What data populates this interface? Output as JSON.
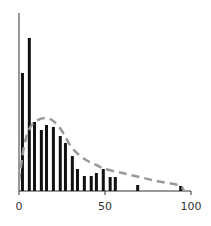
{
  "chart_data": {
    "type": "bar",
    "title": "",
    "xlabel": "",
    "ylabel": "",
    "xlim": [
      0,
      100
    ],
    "ylim": [
      0,
      178
    ],
    "grid": false,
    "legend": null,
    "x_ticks": [
      {
        "value": 0,
        "label": "0"
      },
      {
        "value": 50,
        "label": "50"
      },
      {
        "value": 100,
        "label": "100"
      }
    ],
    "series": [
      {
        "name": "histogram",
        "style": "bars",
        "color": "#111111",
        "x": [
          2,
          6,
          9,
          13,
          16,
          20,
          24,
          27,
          31,
          34,
          38,
          42,
          45,
          49,
          53,
          56,
          69,
          94
        ],
        "values": [
          118,
          153,
          69,
          61,
          66,
          64,
          55,
          48,
          35,
          22,
          15,
          15,
          18,
          22,
          14,
          14,
          6,
          5
        ]
      },
      {
        "name": "fitted-curve",
        "style": "dashed-line",
        "color": "#999999",
        "x": [
          0,
          3,
          6,
          10,
          15,
          20,
          25,
          30,
          35,
          40,
          45,
          50,
          60,
          70,
          80,
          90,
          94,
          96
        ],
        "values": [
          10,
          45,
          62,
          70,
          73,
          70,
          60,
          45,
          36,
          30,
          26,
          22,
          18,
          14,
          10,
          7,
          5,
          0
        ]
      }
    ]
  }
}
